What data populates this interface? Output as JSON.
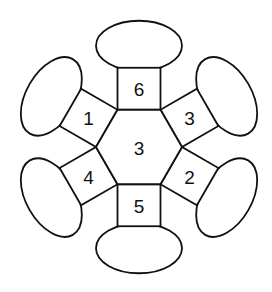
{
  "diagram": {
    "center": {
      "x": 139,
      "y": 147
    },
    "hexagon": {
      "label": "3",
      "radius": 43
    },
    "square_size": 42,
    "ellipse": {
      "rx": 43,
      "ry": 25
    },
    "colors": {
      "stroke": "#111111",
      "fill": "#ffffff",
      "text": "#111111"
    },
    "arms": [
      {
        "position": "top",
        "angle": -90,
        "label": "6"
      },
      {
        "position": "upper-right",
        "angle": -30,
        "label": "3"
      },
      {
        "position": "lower-right",
        "angle": 30,
        "label": "2"
      },
      {
        "position": "bottom",
        "angle": 90,
        "label": "5"
      },
      {
        "position": "lower-left",
        "angle": 150,
        "label": "4"
      },
      {
        "position": "upper-left",
        "angle": 210,
        "label": "1"
      }
    ]
  }
}
